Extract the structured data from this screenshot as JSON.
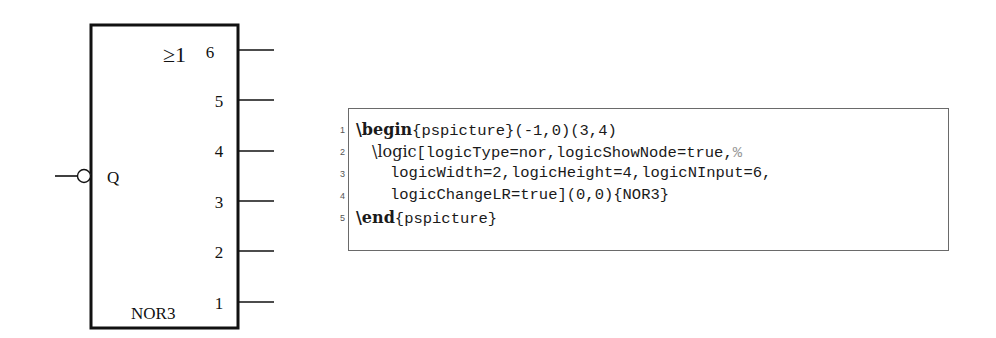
{
  "gate": {
    "symbol": "≥1",
    "output_label": "Q",
    "name": "NOR3",
    "inputs": [
      "1",
      "2",
      "3",
      "4",
      "5",
      "6"
    ],
    "output_negated": true
  },
  "code": {
    "line_numbers": [
      "1",
      "2",
      "3",
      "4",
      "5"
    ],
    "lines": [
      {
        "kw": "\\begin",
        "rest": "{pspicture}(-1,0)(3,4)"
      },
      {
        "cmd": "\\logic",
        "rest": "[logicType=nor,logicShowNode=true,",
        "comment": "%"
      },
      {
        "rest": "logicWidth=2,logicHeight=4,logicNInput=6,"
      },
      {
        "rest": "logicChangeLR=true](0,0){NOR3}"
      },
      {
        "kw": "\\end",
        "rest": "{pspicture}"
      }
    ]
  },
  "colors": {
    "stroke": "#111111",
    "code_border": "#6a6a6a",
    "comment": "#999999"
  }
}
